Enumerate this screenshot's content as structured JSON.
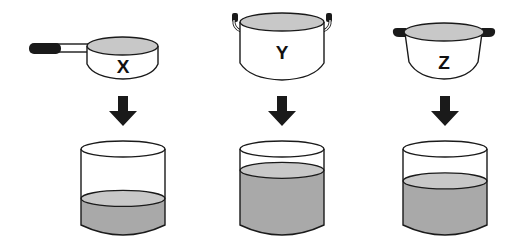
{
  "title": "",
  "colors": {
    "outline": "#1a1a1a",
    "liquid_surface": "#c8c8c8",
    "liquid_body": "#a9a9a9",
    "handle": "#1a1a1a",
    "background": "#ffffff"
  },
  "vessels": [
    {
      "id": "X",
      "label": "X",
      "type": "saucepan-with-long-handle"
    },
    {
      "id": "Y",
      "label": "Y",
      "type": "tall-pot-with-loop-handles"
    },
    {
      "id": "Z",
      "label": "Z",
      "type": "wide-pot-with-side-handles"
    }
  ],
  "arrows": [
    {
      "from": "X",
      "icon": "down-arrow-icon"
    },
    {
      "from": "Y",
      "icon": "down-arrow-icon"
    },
    {
      "from": "Z",
      "icon": "down-arrow-icon"
    }
  ],
  "containers": [
    {
      "source": "X",
      "fill_fraction": 0.35
    },
    {
      "source": "Y",
      "fill_fraction": 0.72
    },
    {
      "source": "Z",
      "fill_fraction": 0.58
    }
  ]
}
